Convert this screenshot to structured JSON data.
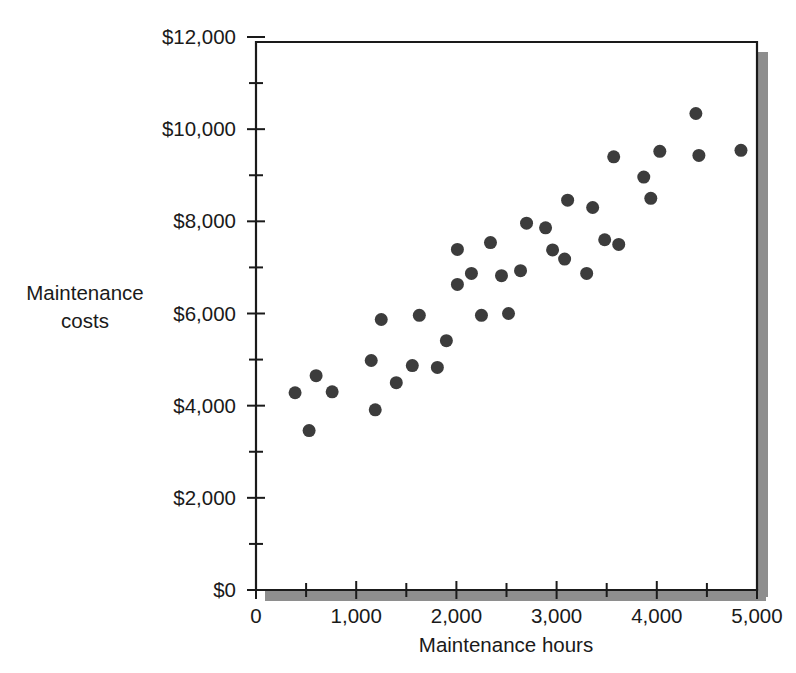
{
  "chart_data": {
    "type": "scatter",
    "title": "",
    "xlabel": "Maintenance hours",
    "ylabel": "Maintenance costs",
    "ylabel_lines": [
      "Maintenance",
      "costs"
    ],
    "xlim": [
      0,
      5000
    ],
    "ylim": [
      0,
      12000
    ],
    "grid": false,
    "legend": null,
    "x_ticks": [
      0,
      500,
      1000,
      1500,
      2000,
      2500,
      3000,
      3500,
      4000,
      4500,
      5000
    ],
    "x_tick_labels": [
      "0",
      "",
      "1,000",
      "",
      "2,000",
      "",
      "3,000",
      "",
      "4,000",
      "",
      "5,000"
    ],
    "x_major_labels": [
      "0",
      "1,000",
      "2,000",
      "3,000",
      "4,000",
      "5,000"
    ],
    "y_ticks": [
      0,
      1000,
      2000,
      3000,
      4000,
      5000,
      6000,
      7000,
      8000,
      9000,
      10000,
      11000,
      12000
    ],
    "y_tick_labels": [
      "$0",
      "",
      "$2,000",
      "",
      "$4,000",
      "",
      "$6,000",
      "",
      "$8,000",
      "",
      "$10,000",
      "",
      "$12,000"
    ],
    "y_major_labels": [
      "$0",
      "$2,000",
      "$4,000",
      "$6,000",
      "$8,000",
      "$10,000",
      "$12,000"
    ],
    "marker_color": "#3c3c3c",
    "marker_size": 13,
    "points": [
      {
        "x": 390,
        "y": 4280
      },
      {
        "x": 600,
        "y": 4650
      },
      {
        "x": 530,
        "y": 3460
      },
      {
        "x": 760,
        "y": 4300
      },
      {
        "x": 1150,
        "y": 4980
      },
      {
        "x": 1190,
        "y": 3910
      },
      {
        "x": 1250,
        "y": 5870
      },
      {
        "x": 1400,
        "y": 4500
      },
      {
        "x": 1560,
        "y": 4870
      },
      {
        "x": 1630,
        "y": 5960
      },
      {
        "x": 1810,
        "y": 4830
      },
      {
        "x": 1900,
        "y": 5410
      },
      {
        "x": 2010,
        "y": 6630
      },
      {
        "x": 2010,
        "y": 7390
      },
      {
        "x": 2150,
        "y": 6870
      },
      {
        "x": 2250,
        "y": 5960
      },
      {
        "x": 2340,
        "y": 7540
      },
      {
        "x": 2450,
        "y": 6820
      },
      {
        "x": 2520,
        "y": 6000
      },
      {
        "x": 2640,
        "y": 6930
      },
      {
        "x": 2700,
        "y": 7960
      },
      {
        "x": 2890,
        "y": 7860
      },
      {
        "x": 2960,
        "y": 7380
      },
      {
        "x": 3080,
        "y": 7180
      },
      {
        "x": 3110,
        "y": 8460
      },
      {
        "x": 3300,
        "y": 6870
      },
      {
        "x": 3360,
        "y": 8300
      },
      {
        "x": 3480,
        "y": 7600
      },
      {
        "x": 3570,
        "y": 9400
      },
      {
        "x": 3620,
        "y": 7500
      },
      {
        "x": 3870,
        "y": 8960
      },
      {
        "x": 3940,
        "y": 8500
      },
      {
        "x": 4030,
        "y": 9520
      },
      {
        "x": 4390,
        "y": 10340
      },
      {
        "x": 4420,
        "y": 9430
      },
      {
        "x": 4840,
        "y": 9540
      }
    ]
  },
  "axes": {
    "x_axis_name": "maintenance-hours-axis",
    "y_axis_name": "maintenance-costs-axis"
  }
}
